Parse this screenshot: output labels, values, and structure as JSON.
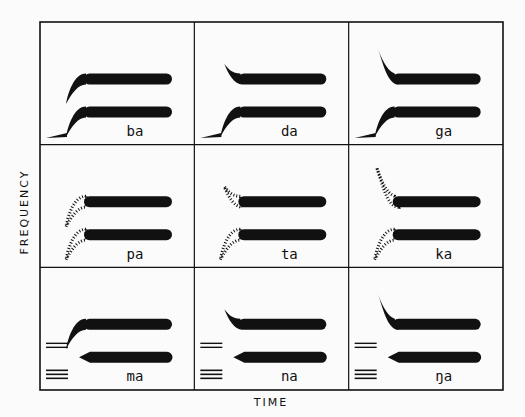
{
  "figure": {
    "axis_y_label": "FREQUENCY",
    "axis_x_label": "TIME",
    "colors": {
      "ink": "#111111",
      "paper": "#fbfbfb"
    },
    "rows": [
      "voiced stops",
      "voiceless stops",
      "nasals"
    ],
    "cells": [
      {
        "syllable": "ba",
        "f2_transition": "rising",
        "f1_transition": "rising",
        "voice_bar": true,
        "aspiration": false,
        "nasal_marks": false
      },
      {
        "syllable": "da",
        "f2_transition": "falling-short",
        "f1_transition": "rising",
        "voice_bar": true,
        "aspiration": false,
        "nasal_marks": false
      },
      {
        "syllable": "ga",
        "f2_transition": "falling-long",
        "f1_transition": "rising",
        "voice_bar": true,
        "aspiration": false,
        "nasal_marks": false
      },
      {
        "syllable": "pa",
        "f2_transition": "rising",
        "f1_transition": "rising",
        "voice_bar": false,
        "aspiration": true,
        "nasal_marks": false
      },
      {
        "syllable": "ta",
        "f2_transition": "falling-short",
        "f1_transition": "rising",
        "voice_bar": false,
        "aspiration": true,
        "nasal_marks": false
      },
      {
        "syllable": "ka",
        "f2_transition": "falling-long",
        "f1_transition": "rising",
        "voice_bar": false,
        "aspiration": true,
        "nasal_marks": false
      },
      {
        "syllable": "ma",
        "f2_transition": "rising",
        "f1_transition": "flat-pointed",
        "voice_bar": false,
        "aspiration": false,
        "nasal_marks": true
      },
      {
        "syllable": "na",
        "f2_transition": "falling-short",
        "f1_transition": "flat-pointed",
        "voice_bar": false,
        "aspiration": false,
        "nasal_marks": true
      },
      {
        "syllable": "ŋa",
        "f2_transition": "falling-long",
        "f1_transition": "flat-pointed",
        "voice_bar": false,
        "aspiration": false,
        "nasal_marks": true
      }
    ]
  }
}
